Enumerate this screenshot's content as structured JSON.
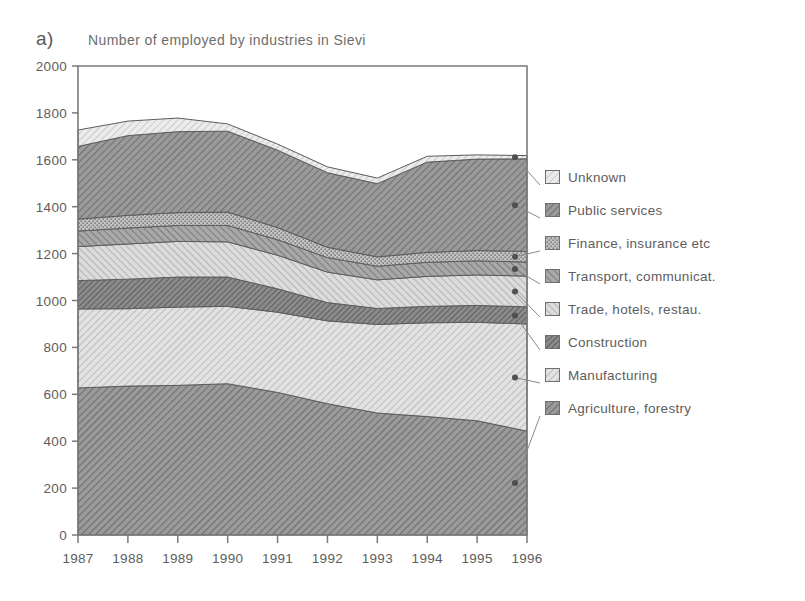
{
  "panel": {
    "label": "a)"
  },
  "chart_data": {
    "type": "area",
    "title": "Number of employed by industries in Sievi",
    "xlabel": "",
    "ylabel": "",
    "stacked": true,
    "grid": false,
    "legend_position": "right",
    "ylim": [
      0,
      2000
    ],
    "ytick_values": [
      0,
      200,
      400,
      600,
      800,
      1000,
      1200,
      1400,
      1600,
      1800,
      2000
    ],
    "ytick_labels": [
      "0",
      "200",
      "400",
      "600",
      "800",
      "1000",
      "1200",
      "1400",
      "1600",
      "1800",
      "2000"
    ],
    "categories": [
      1987,
      1988,
      1989,
      1990,
      1991,
      1992,
      1993,
      1994,
      1995,
      1996
    ],
    "xtick_labels": [
      "1987",
      "1988",
      "1989",
      "1990",
      "1991",
      "1992",
      "1993",
      "1994",
      "1995",
      "1996"
    ],
    "series": [
      {
        "name": "Agriculture, forestry",
        "color": "#8f8f8f",
        "pattern": "hatch-45-dense",
        "values": [
          627,
          635,
          638,
          645,
          608,
          560,
          520,
          505,
          487,
          443
        ]
      },
      {
        "name": "Manufacturing",
        "color": "#d2d2d2",
        "pattern": "hatch-45-light",
        "values": [
          337,
          330,
          334,
          330,
          342,
          353,
          378,
          400,
          420,
          457
        ]
      },
      {
        "name": "Construction",
        "color": "#7e7e7e",
        "pattern": "hatch-45-dark",
        "values": [
          121,
          126,
          128,
          125,
          100,
          78,
          68,
          70,
          72,
          73
        ]
      },
      {
        "name": "Trade, hotels, restau.",
        "color": "#c9c9c9",
        "pattern": "hatch-135-light",
        "values": [
          145,
          150,
          152,
          150,
          143,
          130,
          122,
          128,
          130,
          131
        ]
      },
      {
        "name": "Transport, communicat.",
        "color": "#9b9b9b",
        "pattern": "hatch-135-mid",
        "values": [
          66,
          68,
          68,
          70,
          66,
          62,
          58,
          60,
          60,
          60
        ]
      },
      {
        "name": "Finance, insurance etc",
        "color": "#b7b7b7",
        "pattern": "dots-mid",
        "values": [
          51,
          54,
          55,
          57,
          52,
          44,
          40,
          42,
          44,
          45
        ]
      },
      {
        "name": "Public services",
        "color": "#8a8a8a",
        "pattern": "hatch-45-mid",
        "values": [
          310,
          340,
          345,
          345,
          330,
          318,
          312,
          385,
          390,
          395
        ]
      },
      {
        "name": "Unknown",
        "color": "#d8d8d8",
        "pattern": "hatch-45-faint",
        "values": [
          70,
          62,
          58,
          31,
          26,
          25,
          24,
          25,
          18,
          14
        ]
      }
    ],
    "totals": [
      1727,
      1765,
      1778,
      1753,
      1667,
      1570,
      1522,
      1615,
      1621,
      1618
    ]
  },
  "legend": {
    "items": [
      {
        "label": "Unknown"
      },
      {
        "label": "Public services"
      },
      {
        "label": "Finance, insurance etc"
      },
      {
        "label": "Transport, communicat."
      },
      {
        "label": "Trade, hotels, restau."
      },
      {
        "label": "Construction"
      },
      {
        "label": "Manufacturing"
      },
      {
        "label": "Agriculture, forestry"
      }
    ]
  }
}
